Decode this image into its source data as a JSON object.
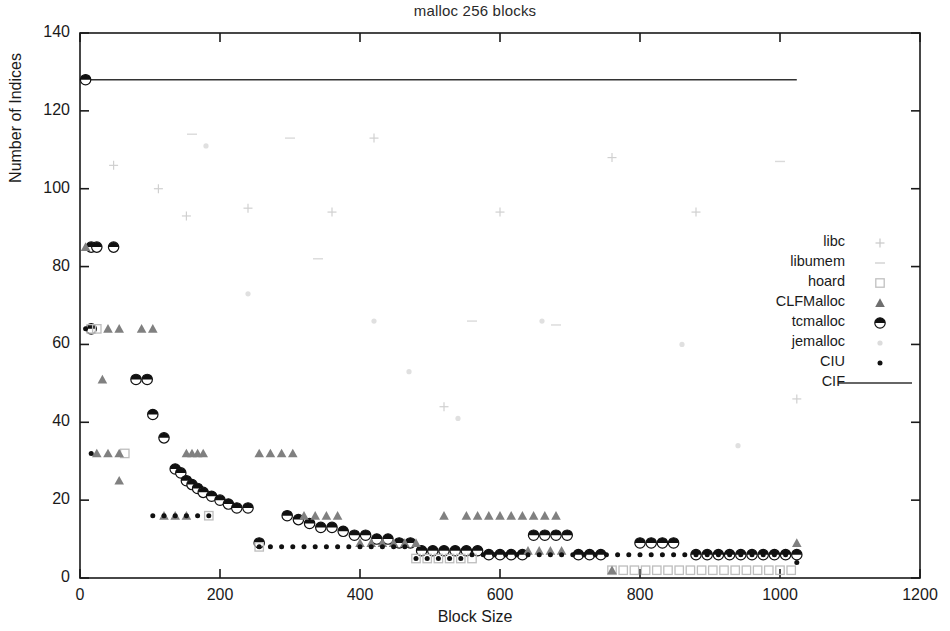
{
  "chart_data": {
    "type": "scatter",
    "title": "malloc 256 blocks",
    "xlabel": "Block Size",
    "ylabel": "Number of Indices",
    "xlim": [
      0,
      1200
    ],
    "ylim": [
      0,
      140
    ],
    "xticks": [
      0,
      200,
      400,
      600,
      800,
      1000,
      1200
    ],
    "yticks": [
      0,
      20,
      40,
      60,
      80,
      100,
      120,
      140
    ],
    "grid": false,
    "legend_position": "right-inside",
    "legend": [
      {
        "name": "libc",
        "marker": "plus",
        "color": "#c8c8c8"
      },
      {
        "name": "libumem",
        "marker": "dash",
        "color": "#d2d2d2"
      },
      {
        "name": "hoard",
        "marker": "open-square",
        "color": "#c0c0c0"
      },
      {
        "name": "CLFMalloc",
        "marker": "filled-triangle",
        "color": "#6e6e6e"
      },
      {
        "name": "tcmalloc",
        "marker": "half-filled-circle",
        "color": "#1a1a1a"
      },
      {
        "name": "jemalloc",
        "marker": "faint-dot",
        "color": "#dcdcdc"
      },
      {
        "name": "CIU",
        "marker": "small-dot",
        "color": "#111111"
      },
      {
        "name": "CIF",
        "marker": "line",
        "color": "#333333"
      }
    ],
    "series": [
      {
        "name": "CIF",
        "marker": "line",
        "color": "#333333",
        "points": [
          [
            8,
            128
          ],
          [
            1024,
            128
          ]
        ]
      },
      {
        "name": "tcmalloc",
        "marker": "half-filled-circle",
        "color": "#1a1a1a",
        "points": [
          [
            16,
            85
          ],
          [
            24,
            85
          ],
          [
            48,
            85
          ],
          [
            16,
            64
          ],
          [
            80,
            51
          ],
          [
            96,
            51
          ],
          [
            104,
            42
          ],
          [
            120,
            36
          ],
          [
            136,
            28
          ],
          [
            144,
            27
          ],
          [
            152,
            25
          ],
          [
            160,
            24
          ],
          [
            168,
            23
          ],
          [
            176,
            22
          ],
          [
            188,
            21
          ],
          [
            200,
            20
          ],
          [
            212,
            19
          ],
          [
            224,
            18
          ],
          [
            240,
            18
          ],
          [
            256,
            9
          ],
          [
            296,
            16
          ],
          [
            312,
            15
          ],
          [
            328,
            14
          ],
          [
            344,
            13
          ],
          [
            360,
            13
          ],
          [
            376,
            12
          ],
          [
            392,
            11
          ],
          [
            408,
            11
          ],
          [
            424,
            10
          ],
          [
            440,
            10
          ],
          [
            456,
            9
          ],
          [
            472,
            9
          ],
          [
            488,
            7
          ],
          [
            504,
            7
          ],
          [
            520,
            7
          ],
          [
            536,
            7
          ],
          [
            552,
            7
          ],
          [
            568,
            7
          ],
          [
            584,
            6
          ],
          [
            600,
            6
          ],
          [
            616,
            6
          ],
          [
            632,
            6
          ],
          [
            648,
            11
          ],
          [
            664,
            11
          ],
          [
            680,
            11
          ],
          [
            696,
            11
          ],
          [
            712,
            6
          ],
          [
            728,
            6
          ],
          [
            744,
            6
          ],
          [
            800,
            9
          ],
          [
            816,
            9
          ],
          [
            832,
            9
          ],
          [
            848,
            9
          ],
          [
            880,
            6
          ],
          [
            896,
            6
          ],
          [
            912,
            6
          ],
          [
            928,
            6
          ],
          [
            944,
            6
          ],
          [
            960,
            6
          ],
          [
            976,
            6
          ],
          [
            992,
            6
          ],
          [
            1008,
            6
          ],
          [
            1024,
            6
          ]
        ]
      },
      {
        "name": "hoard",
        "marker": "open-square",
        "color": "#bdbdbd",
        "points": [
          [
            16,
            64
          ],
          [
            24,
            64
          ],
          [
            64,
            32
          ],
          [
            184,
            16
          ],
          [
            256,
            8
          ],
          [
            480,
            5
          ],
          [
            496,
            5
          ],
          [
            512,
            5
          ],
          [
            528,
            5
          ],
          [
            544,
            5
          ],
          [
            560,
            5
          ],
          [
            760,
            2
          ],
          [
            776,
            2
          ],
          [
            792,
            2
          ],
          [
            808,
            2
          ],
          [
            824,
            2
          ],
          [
            840,
            2
          ],
          [
            856,
            2
          ],
          [
            872,
            2
          ],
          [
            888,
            2
          ],
          [
            904,
            2
          ],
          [
            920,
            2
          ],
          [
            936,
            2
          ],
          [
            952,
            2
          ],
          [
            968,
            2
          ],
          [
            984,
            2
          ],
          [
            1000,
            2
          ],
          [
            1016,
            2
          ]
        ]
      },
      {
        "name": "CLFMalloc",
        "marker": "filled-triangle",
        "color": "#808080",
        "points": [
          [
            8,
            85
          ],
          [
            40,
            64
          ],
          [
            56,
            64
          ],
          [
            88,
            64
          ],
          [
            104,
            64
          ],
          [
            32,
            51
          ],
          [
            24,
            32
          ],
          [
            40,
            32
          ],
          [
            56,
            32
          ],
          [
            56,
            25
          ],
          [
            152,
            32
          ],
          [
            160,
            32
          ],
          [
            168,
            32
          ],
          [
            176,
            32
          ],
          [
            256,
            32
          ],
          [
            272,
            32
          ],
          [
            288,
            32
          ],
          [
            304,
            32
          ],
          [
            120,
            16
          ],
          [
            136,
            16
          ],
          [
            152,
            16
          ],
          [
            320,
            16
          ],
          [
            336,
            16
          ],
          [
            352,
            16
          ],
          [
            368,
            16
          ],
          [
            520,
            16
          ],
          [
            552,
            16
          ],
          [
            568,
            16
          ],
          [
            584,
            16
          ],
          [
            600,
            16
          ],
          [
            616,
            16
          ],
          [
            632,
            16
          ],
          [
            648,
            16
          ],
          [
            664,
            16
          ],
          [
            680,
            16
          ],
          [
            400,
            9
          ],
          [
            416,
            9
          ],
          [
            432,
            9
          ],
          [
            448,
            9
          ],
          [
            464,
            9
          ],
          [
            480,
            9
          ],
          [
            640,
            7
          ],
          [
            656,
            7
          ],
          [
            672,
            7
          ],
          [
            688,
            7
          ],
          [
            760,
            2
          ],
          [
            1024,
            9
          ]
        ]
      },
      {
        "name": "CIU",
        "marker": "small-dot",
        "color": "#111111",
        "points": [
          [
            8,
            64
          ],
          [
            16,
            32
          ],
          [
            104,
            16
          ],
          [
            120,
            16
          ],
          [
            136,
            16
          ],
          [
            152,
            16
          ],
          [
            168,
            16
          ],
          [
            184,
            16
          ],
          [
            256,
            8
          ],
          [
            272,
            8
          ],
          [
            288,
            8
          ],
          [
            304,
            8
          ],
          [
            320,
            8
          ],
          [
            336,
            8
          ],
          [
            352,
            8
          ],
          [
            368,
            8
          ],
          [
            384,
            8
          ],
          [
            400,
            8
          ],
          [
            416,
            8
          ],
          [
            432,
            8
          ],
          [
            448,
            8
          ],
          [
            464,
            8
          ],
          [
            480,
            5
          ],
          [
            496,
            5
          ],
          [
            512,
            5
          ],
          [
            528,
            5
          ],
          [
            544,
            5
          ],
          [
            560,
            6
          ],
          [
            576,
            6
          ],
          [
            592,
            6
          ],
          [
            608,
            6
          ],
          [
            624,
            6
          ],
          [
            640,
            6
          ],
          [
            656,
            6
          ],
          [
            672,
            6
          ],
          [
            688,
            6
          ],
          [
            704,
            6
          ],
          [
            720,
            6
          ],
          [
            736,
            6
          ],
          [
            752,
            6
          ],
          [
            768,
            6
          ],
          [
            784,
            6
          ],
          [
            800,
            6
          ],
          [
            816,
            6
          ],
          [
            832,
            6
          ],
          [
            848,
            6
          ],
          [
            864,
            6
          ],
          [
            880,
            6
          ],
          [
            896,
            6
          ],
          [
            912,
            6
          ],
          [
            928,
            6
          ],
          [
            944,
            6
          ],
          [
            960,
            6
          ],
          [
            976,
            6
          ],
          [
            992,
            6
          ],
          [
            1008,
            6
          ],
          [
            1024,
            4
          ]
        ]
      },
      {
        "name": "libc",
        "marker": "plus",
        "color": "#d0d0d0",
        "points": [
          [
            48,
            106
          ],
          [
            112,
            100
          ],
          [
            152,
            93
          ],
          [
            240,
            95
          ],
          [
            360,
            94
          ],
          [
            420,
            113
          ],
          [
            520,
            44
          ],
          [
            600,
            94
          ],
          [
            760,
            108
          ],
          [
            880,
            94
          ],
          [
            1024,
            46
          ]
        ]
      },
      {
        "name": "libumem",
        "marker": "dash",
        "color": "#dadada",
        "points": [
          [
            160,
            114
          ],
          [
            300,
            113
          ],
          [
            340,
            82
          ],
          [
            560,
            66
          ],
          [
            680,
            65
          ],
          [
            1000,
            107
          ]
        ]
      },
      {
        "name": "jemalloc",
        "marker": "faint-dot",
        "color": "#e0e0e0",
        "points": [
          [
            180,
            111
          ],
          [
            240,
            73
          ],
          [
            420,
            66
          ],
          [
            470,
            53
          ],
          [
            540,
            41
          ],
          [
            660,
            66
          ],
          [
            860,
            60
          ],
          [
            940,
            34
          ]
        ]
      }
    ]
  }
}
